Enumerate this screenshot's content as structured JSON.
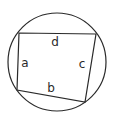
{
  "diagram": {
    "type": "cyclic-quadrilateral",
    "stroke_color": "#2a2a2a",
    "background": "#ffffff",
    "circle": {
      "cx": 57,
      "cy": 62,
      "r": 49
    },
    "vertices": [
      {
        "id": "top-left",
        "x": 19,
        "y": 33
      },
      {
        "id": "top-right",
        "x": 96,
        "y": 34
      },
      {
        "id": "bottom-right",
        "x": 85,
        "y": 102
      },
      {
        "id": "bottom-left",
        "x": 17,
        "y": 90
      }
    ],
    "sides": [
      {
        "label": "a",
        "from": "top-left",
        "to": "bottom-left",
        "label_x": 25,
        "label_y": 67
      },
      {
        "label": "b",
        "from": "bottom-left",
        "to": "bottom-right",
        "label_x": 51,
        "label_y": 92
      },
      {
        "label": "c",
        "from": "bottom-right",
        "to": "top-right",
        "label_x": 82,
        "label_y": 68
      },
      {
        "label": "d",
        "from": "top-right",
        "to": "top-left",
        "label_x": 55,
        "label_y": 46
      }
    ]
  }
}
